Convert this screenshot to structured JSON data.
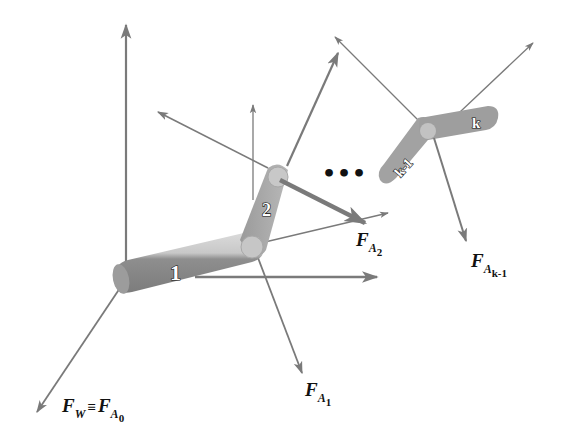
{
  "diagram": {
    "colors": {
      "arrow": "#7a7a7a",
      "link_body": "#8c8c8c",
      "link_highlight": "#d2d2d2",
      "joint": "#c4c4c4",
      "text": "#111111"
    },
    "links": [
      {
        "label": "1"
      },
      {
        "label": "2"
      },
      {
        "label": "k-1"
      },
      {
        "label": "k"
      }
    ],
    "ellipsis": "•••",
    "forces": {
      "world": {
        "main": "F",
        "sub": "W",
        "equiv": "≡",
        "main2": "F",
        "sub2": "A",
        "subsub2": "0"
      },
      "a1": {
        "main": "F",
        "sub": "A",
        "subsub": "1"
      },
      "a2": {
        "main": "F",
        "sub": "A",
        "subsub": "2"
      },
      "ak1": {
        "main": "F",
        "sub": "A",
        "subsub": "k-1"
      }
    }
  }
}
